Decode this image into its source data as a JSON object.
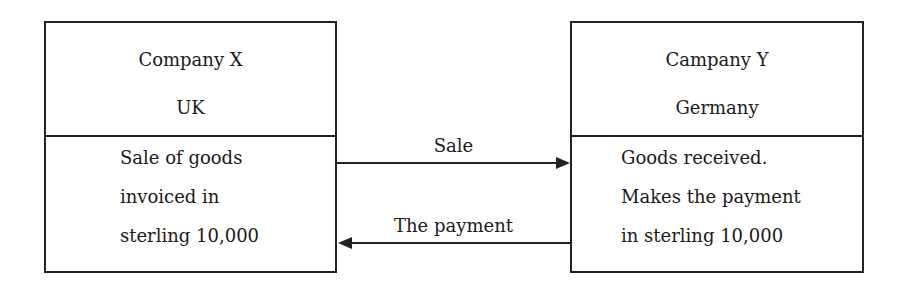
{
  "left_box": {
    "name": "Company X",
    "country": "UK",
    "lines": [
      "Sale of goods",
      "invoiced in",
      "sterling 10,000"
    ]
  },
  "right_box": {
    "name": "Campany Y",
    "country": "Germany",
    "lines": [
      "Goods received.",
      "Makes the payment",
      "in sterling 10,000"
    ]
  },
  "arrows": {
    "sale": "Sale",
    "payment": "The payment"
  }
}
